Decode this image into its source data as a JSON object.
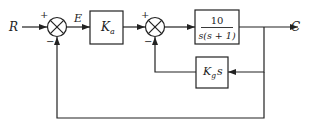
{
  "diagram": {
    "type": "block-diagram",
    "signals": {
      "input": "R",
      "error": "E",
      "output": "C"
    },
    "summing_junctions": [
      {
        "id": "sum1",
        "signs": {
          "top": "+",
          "bottom": "−"
        }
      },
      {
        "id": "sum2",
        "signs": {
          "top": "+",
          "bottom": "−"
        }
      }
    ],
    "blocks": {
      "amplifier": {
        "symbol": "K",
        "subscript": "a"
      },
      "plant": {
        "numerator": "10",
        "denominator": "s(s + 1)"
      },
      "tach_feedback": {
        "symbol": "K",
        "subscript": "g",
        "suffix": "s"
      }
    },
    "colors": {
      "line": "#222222",
      "background": "#ffffff"
    }
  }
}
